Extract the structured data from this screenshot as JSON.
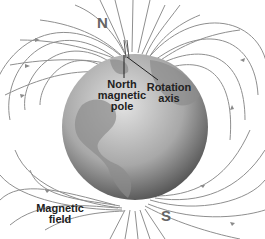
{
  "diagram": {
    "labels": {
      "north": "N",
      "south": "S",
      "north_magnetic_pole": [
        "North",
        "magnetic",
        "pole"
      ],
      "rotation_axis": [
        "Rotation",
        "axis"
      ],
      "magnetic_field": [
        "Magnetic",
        "field"
      ]
    },
    "colors": {
      "field_lines": "#8a8a8a",
      "globe_light": "#d8d8d8",
      "globe_dark": "#3a3a3a",
      "land": "#9a9a9a",
      "text": "#222222",
      "pole_letters": "#666666"
    }
  }
}
